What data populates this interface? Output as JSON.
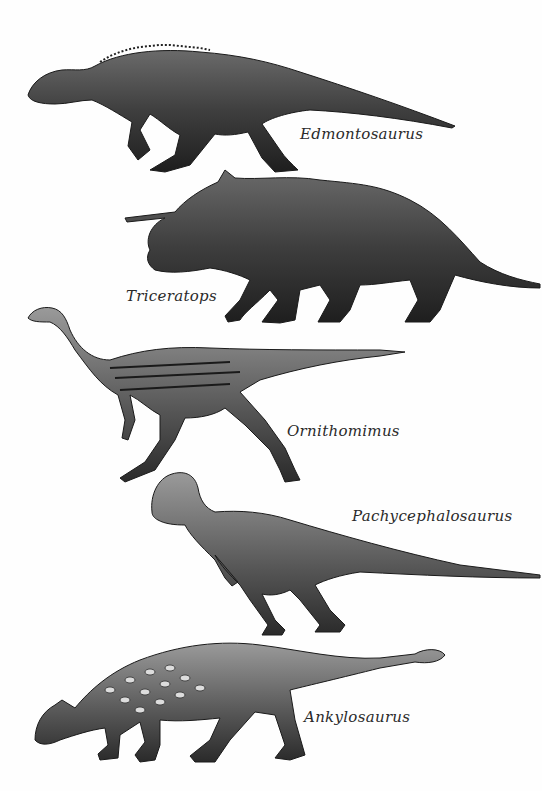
{
  "plate": {
    "background": "#fefefe",
    "ink_color": "#2a2a2a",
    "specimens": [
      {
        "id": "edmontosaurus",
        "name": "Edmontosaurus"
      },
      {
        "id": "triceratops",
        "name": "Triceratops"
      },
      {
        "id": "ornithomimus",
        "name": "Ornithomimus"
      },
      {
        "id": "pachycephalosaurus",
        "name": "Pachycephalosaurus"
      },
      {
        "id": "ankylosaurus",
        "name": "Ankylosaurus"
      }
    ]
  }
}
